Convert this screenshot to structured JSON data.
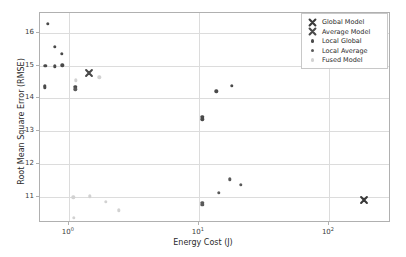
{
  "chart_data": {
    "type": "scatter",
    "title": "",
    "xlabel": "Energy Cost (J)",
    "ylabel": "Root Mean Square Error (RMSE)",
    "xscale": "log",
    "yscale": "linear",
    "xlim": [
      0.6,
      300
    ],
    "ylim": [
      10.2,
      16.6
    ],
    "xticks": [
      "10^0",
      "10^1",
      "10^2"
    ],
    "xtick_labels": [
      "10",
      "10",
      "10"
    ],
    "xtick_exponents": [
      "0",
      "1",
      "2"
    ],
    "xtick_values": [
      1,
      10,
      100
    ],
    "yticks": [
      11,
      12,
      13,
      14,
      15,
      16
    ],
    "ytick_labels": [
      "11",
      "12",
      "13",
      "14",
      "15",
      "16"
    ],
    "grid": true,
    "legend_position": "upper right",
    "colors": {
      "global_model": "#3a3a3a",
      "average_model": "#4a4a4a",
      "local_global": "#4a4a4a",
      "local_average": "#5a5a5a",
      "fused_model": "#d2d2d2",
      "grid": "#dcdcdc",
      "frame": "#b0b0b0",
      "background": "#ffffff"
    },
    "series": [
      {
        "name": "Global Model",
        "marker": "X",
        "color": "#3a3a3a",
        "points": [
          {
            "x": 187.0,
            "y": 10.89
          }
        ]
      },
      {
        "name": "Average Model",
        "marker": "X",
        "color": "#4a4a4a",
        "points": [
          {
            "x": 1.43,
            "y": 14.77
          }
        ]
      },
      {
        "name": "Local Global",
        "marker": "o",
        "color": "#4a4a4a",
        "points": [
          {
            "x": 0.69,
            "y": 16.27
          },
          {
            "x": 0.78,
            "y": 15.57
          },
          {
            "x": 0.88,
            "y": 15.35
          },
          {
            "x": 0.66,
            "y": 14.99
          },
          {
            "x": 0.78,
            "y": 14.98
          },
          {
            "x": 0.89,
            "y": 15.01
          },
          {
            "x": 0.655,
            "y": 14.38
          },
          {
            "x": 0.655,
            "y": 14.33
          },
          {
            "x": 1.12,
            "y": 14.35
          },
          {
            "x": 10.6,
            "y": 13.43
          },
          {
            "x": 10.6,
            "y": 13.36
          },
          {
            "x": 13.6,
            "y": 14.21
          },
          {
            "x": 18.0,
            "y": 14.38
          }
        ]
      },
      {
        "name": "Local Average",
        "marker": "o",
        "color": "#5a5a5a",
        "points": [
          {
            "x": 1.12,
            "y": 14.28
          },
          {
            "x": 10.6,
            "y": 10.82
          },
          {
            "x": 10.6,
            "y": 10.76
          },
          {
            "x": 14.3,
            "y": 11.12
          },
          {
            "x": 17.3,
            "y": 11.53
          },
          {
            "x": 21.0,
            "y": 11.37
          }
        ]
      },
      {
        "name": "Fused Model",
        "marker": "o",
        "color": "#d2d2d2",
        "points": [
          {
            "x": 1.13,
            "y": 14.55
          },
          {
            "x": 1.72,
            "y": 14.64
          },
          {
            "x": 1.08,
            "y": 10.98
          },
          {
            "x": 1.45,
            "y": 11.01
          },
          {
            "x": 1.93,
            "y": 10.84
          },
          {
            "x": 2.42,
            "y": 10.59
          },
          {
            "x": 1.09,
            "y": 10.36
          }
        ]
      }
    ]
  },
  "legend": {
    "entries": [
      {
        "label": "Global Model",
        "marker": "X",
        "color": "#3a3a3a"
      },
      {
        "label": "Average Model",
        "marker": "X",
        "color": "#4a4a4a"
      },
      {
        "label": "Local Global",
        "marker": "dot",
        "color": "#4a4a4a"
      },
      {
        "label": "Local Average",
        "marker": "dot",
        "color": "#5a5a5a"
      },
      {
        "label": "Fused Model",
        "marker": "dot",
        "color": "#d2d2d2"
      }
    ]
  }
}
